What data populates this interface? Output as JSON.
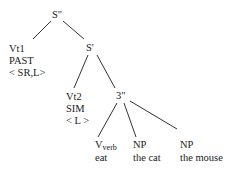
{
  "tree": {
    "root": "S\"",
    "nodes": {
      "s2": "S\"",
      "vt1": {
        "label": "Vt1",
        "tense": "PAST",
        "features": "< SR,L>"
      },
      "s1": "S'",
      "vt2": {
        "label": "Vt2",
        "aspect": "SIM",
        "features": "< L >"
      },
      "n3": "3\"",
      "vverb": {
        "label": "V",
        "subscript": "verb",
        "word": "eat"
      },
      "np1": {
        "label": "NP",
        "word": "the cat"
      },
      "np2": {
        "label": "NP",
        "word": "the mouse"
      }
    },
    "edges": [
      [
        "S\"",
        "Vt1"
      ],
      [
        "S\"",
        "S'"
      ],
      [
        "S'",
        "Vt2"
      ],
      [
        "S'",
        "3\""
      ],
      [
        "3\"",
        "V_verb"
      ],
      [
        "3\"",
        "NP (the cat)"
      ],
      [
        "3\"",
        "NP (the mouse)"
      ]
    ]
  }
}
